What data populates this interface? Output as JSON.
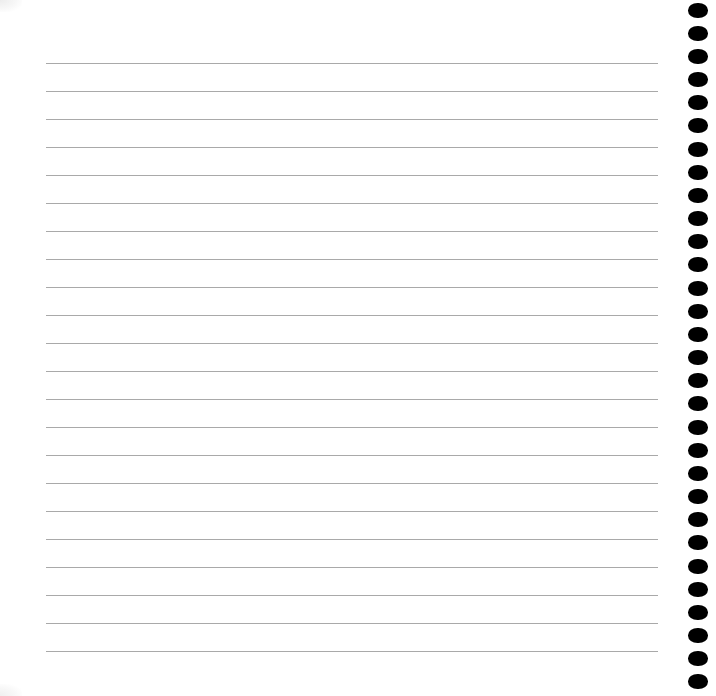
{
  "sheet": {
    "type": "ruled-notebook-page",
    "background_color": "#ffffff",
    "rule_color": "#a9a9a9",
    "hole_color": "#000000",
    "rule_count": 22,
    "rule_first_y": 63,
    "rule_spacing": 28,
    "rule_left": 46,
    "rule_right": 658,
    "hole_count": 30,
    "hole_first_center_y": 10,
    "hole_spacing": 23.17,
    "hole_left": 688,
    "hole_width": 20,
    "hole_height": 15
  }
}
